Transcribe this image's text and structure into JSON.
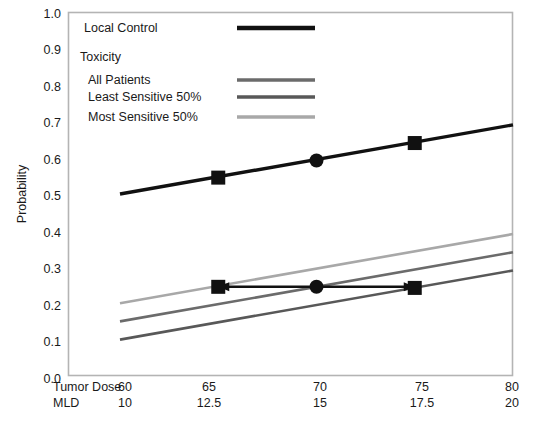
{
  "chart_data": {
    "type": "line",
    "title": "",
    "xlabel": "",
    "ylabel": "Probability",
    "xlim": [
      60,
      80
    ],
    "ylim": [
      0.0,
      1.0
    ],
    "grid": false,
    "legend_position": "top-left inside plot",
    "x_axes": [
      {
        "name": "Tumor Dose",
        "ticks": [
          "60",
          "65",
          "70",
          "75",
          "80"
        ],
        "values": [
          60,
          65,
          70,
          75,
          80
        ]
      },
      {
        "name": "MLD",
        "ticks": [
          "10",
          "12.5",
          "15",
          "17.5",
          "20"
        ],
        "values": [
          10,
          12.5,
          15,
          17.5,
          20
        ]
      }
    ],
    "y_ticks": [
      "0.0",
      "0.1",
      "0.2",
      "0.3",
      "0.4",
      "0.5",
      "0.6",
      "0.7",
      "0.8",
      "0.9",
      "1.0"
    ],
    "y_values": [
      0.0,
      0.1,
      0.2,
      0.3,
      0.4,
      0.5,
      0.6,
      0.7,
      0.8,
      0.9,
      1.0
    ],
    "series": [
      {
        "name": "Local Control",
        "color": "#111111",
        "width": 3.4,
        "x": [
          60,
          80
        ],
        "values": [
          0.5,
          0.69
        ],
        "markers": [
          {
            "x": 65,
            "y": 0.545,
            "shape": "square"
          },
          {
            "x": 70,
            "y": 0.592,
            "shape": "circle"
          },
          {
            "x": 75,
            "y": 0.64,
            "shape": "square"
          }
        ]
      },
      {
        "name": "All Patients",
        "color": "#6b6b6b",
        "width": 2.6,
        "x": [
          60,
          80
        ],
        "values": [
          0.15,
          0.34
        ],
        "markers": []
      },
      {
        "name": "Least Sensitive 50%",
        "color": "#585858",
        "width": 2.6,
        "x": [
          60,
          80
        ],
        "values": [
          0.1,
          0.29
        ],
        "markers": []
      },
      {
        "name": "Most Sensitive 50%",
        "color": "#a8a8a8",
        "width": 2.6,
        "x": [
          60,
          80
        ],
        "values": [
          0.2,
          0.39
        ],
        "markers": []
      }
    ],
    "annotation": {
      "type": "double-headed-arrow",
      "y": 0.245,
      "x_start": 65,
      "x_end": 75,
      "color": "#111111",
      "markers": [
        {
          "x": 65,
          "y": 0.245,
          "shape": "square"
        },
        {
          "x": 70,
          "y": 0.245,
          "shape": "circle"
        },
        {
          "x": 75,
          "y": 0.242,
          "shape": "square"
        }
      ]
    },
    "legend": {
      "entries": [
        {
          "label": "Local Control",
          "color": "#111111",
          "width": 4.2,
          "swatch": true
        },
        {
          "label": "Toxicity",
          "color": "",
          "swatch": false
        },
        {
          "label": "All Patients",
          "color": "#6b6b6b",
          "width": 3.2,
          "swatch": true
        },
        {
          "label": "Least Sensitive 50%",
          "color": "#585858",
          "width": 3.2,
          "swatch": true
        },
        {
          "label": "Most Sensitive 50%",
          "color": "#a8a8a8",
          "width": 3.2,
          "swatch": true
        }
      ]
    }
  },
  "labels": {
    "y_axis_title": "Probability",
    "y_0_0": "0.0",
    "y_0_1": "0.1",
    "y_0_2": "0.2",
    "y_0_3": "0.3",
    "y_0_4": "0.4",
    "y_0_5": "0.5",
    "y_0_6": "0.6",
    "y_0_7": "0.7",
    "y_0_8": "0.8",
    "y_0_9": "0.9",
    "y_1_0": "1.0",
    "row1_name": "Tumor Dose",
    "row1_t1": "60",
    "row1_t2": "65",
    "row1_t3": "70",
    "row1_t4": "75",
    "row1_t5": "80",
    "row2_name": "MLD",
    "row2_t1": "10",
    "row2_t2": "12.5",
    "row2_t3": "15",
    "row2_t4": "17.5",
    "row2_t5": "20",
    "legend_local_control": "Local Control",
    "legend_toxicity": "Toxicity",
    "legend_all_patients": "All Patients",
    "legend_least_sensitive": "Least Sensitive 50%",
    "legend_most_sensitive": "Most Sensitive 50%"
  }
}
